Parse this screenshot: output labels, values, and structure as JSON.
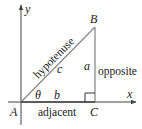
{
  "diagram": {
    "type": "right-triangle",
    "axes": {
      "x_label": "x",
      "y_label": "y"
    },
    "vertices": {
      "A": "A",
      "B": "B",
      "C": "C"
    },
    "sides": {
      "hypotenuse": {
        "letter": "c",
        "name": "hypotenuse"
      },
      "opposite": {
        "letter": "a",
        "name": "opposite"
      },
      "adjacent": {
        "letter": "b",
        "name": "adjacent"
      }
    },
    "angle": "θ",
    "colors": {
      "triangle": "#8a8a8a",
      "axes": "#444444",
      "text": "#222222"
    }
  }
}
